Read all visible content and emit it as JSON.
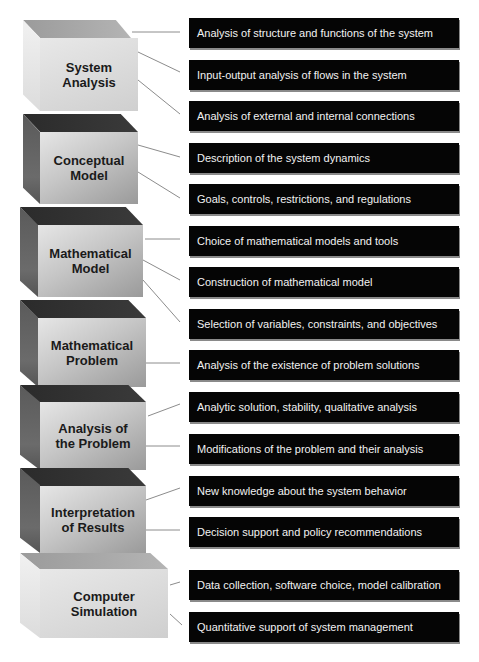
{
  "stages": [
    {
      "label": "System\nAnalysis",
      "label_lines": [
        "System",
        "Analysis"
      ],
      "shade": "light",
      "items": [
        "Analysis of structure and functions of the system",
        "Input-output analysis of flows in the system",
        "Analysis of external and internal connections"
      ]
    },
    {
      "label_lines": [
        "Conceptual",
        "Model"
      ],
      "shade": "dark",
      "items": [
        "Description of the system dynamics",
        "Goals, controls, restrictions, and regulations"
      ]
    },
    {
      "label_lines": [
        "Mathematical",
        "Model"
      ],
      "shade": "dark",
      "items": [
        "Choice of mathematical models and tools",
        "Construction of mathematical model",
        "Selection of variables, constraints, and objectives"
      ]
    },
    {
      "label_lines": [
        "Mathematical",
        "Problem"
      ],
      "shade": "dark",
      "items": [
        "Analysis of the existence of problem solutions"
      ]
    },
    {
      "label_lines": [
        "Analysis of",
        "the Problem"
      ],
      "shade": "dark",
      "items": [
        "Analytic solution, stability, qualitative analysis",
        "Modifications of the problem and their analysis"
      ]
    },
    {
      "label_lines": [
        "Interpretation",
        "of Results"
      ],
      "shade": "dark",
      "items": [
        "New knowledge about the system behavior",
        "Decision support and policy recommendations"
      ]
    },
    {
      "label_lines": [
        "Computer",
        "Simulation"
      ],
      "shade": "light",
      "items": [
        "Data collection, software choice, model calibration",
        "Quantitative support of system management"
      ]
    }
  ],
  "colors": {
    "item_background": "#050505",
    "item_text": "#f2f2f2",
    "connector": "#8c8c8c",
    "block_label": "#1a1a1a"
  }
}
